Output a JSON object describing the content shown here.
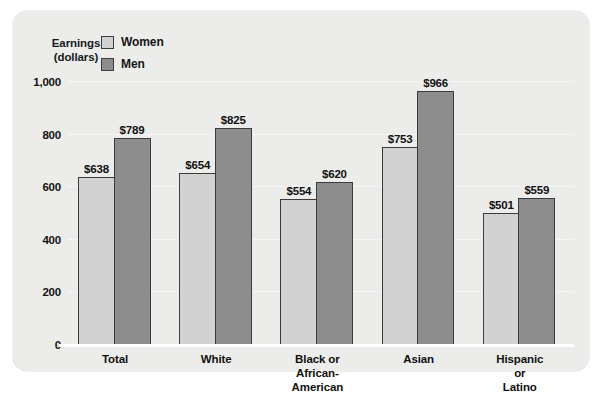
{
  "chart_data": {
    "type": "bar",
    "title": "",
    "xlabel": "",
    "ylabel": "Earnings (dollars)",
    "ylabel_line1": "Earnings",
    "ylabel_line2": "(dollars)",
    "ylim": [
      0,
      1000
    ],
    "ytick_values": [
      0,
      200,
      400,
      600,
      800,
      1000
    ],
    "ytick_labels": [
      "0",
      "200",
      "400",
      "600",
      "800",
      "1,000"
    ],
    "grid": true,
    "grid_style": "white dotted horizontal",
    "legend_position": "top-left",
    "categories": [
      "Total",
      "White",
      "Black or\nAfrican-American",
      "Asian",
      "Hispanic or Latino"
    ],
    "series": [
      {
        "name": "Women",
        "color": "#d2d2d2",
        "values": [
          638,
          654,
          554,
          753,
          501
        ],
        "value_labels": [
          "$638",
          "$654",
          "$554",
          "$753",
          "$501"
        ]
      },
      {
        "name": "Men",
        "color": "#8d8d8d",
        "values": [
          789,
          825,
          620,
          966,
          559
        ],
        "value_labels": [
          "$789",
          "$825",
          "$620",
          "$966",
          "$559"
        ]
      }
    ]
  },
  "legend": {
    "items": [
      {
        "label": "Women",
        "swatch": "women"
      },
      {
        "label": "Men",
        "swatch": "men"
      }
    ]
  },
  "colors": {
    "panel_background": "#ececeb",
    "women_bar": "#d2d2d2",
    "men_bar": "#8d8d8d",
    "bar_outline": "#3b3b3b",
    "gridline": "#ffffff",
    "text": "#111111"
  }
}
